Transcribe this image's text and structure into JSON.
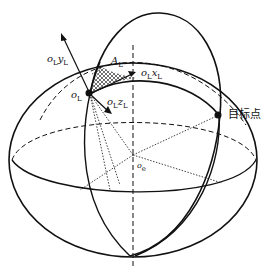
{
  "diagram": {
    "type": "geometric-sphere-coordinate-diagram",
    "labels": {
      "y_axis": {
        "base": "o",
        "sub1": "L",
        "var": "y",
        "sub2": "L"
      },
      "x_axis": {
        "base": "o",
        "sub1": "L",
        "var": "x",
        "sub2": "L"
      },
      "z_axis": {
        "base": "o",
        "sub1": "L",
        "var": "z",
        "sub2": "L"
      },
      "origin": {
        "base": "o",
        "sub": "L"
      },
      "angle": {
        "base": "A",
        "accent": "˜",
        "sub": "L"
      },
      "center": {
        "base": "o",
        "sub": "e"
      },
      "target": "目标点"
    },
    "colors": {
      "stroke": "#111111",
      "background": "#ffffff"
    }
  }
}
